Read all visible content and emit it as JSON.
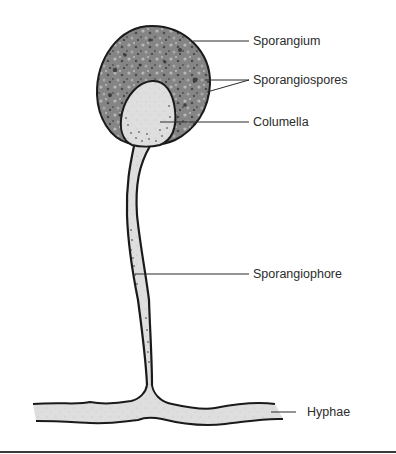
{
  "diagram": {
    "labels": {
      "sporangium": "Sporangium",
      "sporangiospores": "Sporangiospores",
      "columella": "Columella",
      "sporangiophore": "Sporangiophore",
      "hyphae": "Hyphae"
    },
    "colors": {
      "outline": "#1a1a1a",
      "sporangium_fill": "#7d7d7d",
      "spore_dark": "#3c3c3c",
      "spore_light": "#b5b5b5",
      "columella_fill": "#dcdcdc",
      "stalk_fill": "#d6d6d6",
      "leader_line": "#2b2b2b",
      "text": "#2b2b2b"
    }
  }
}
